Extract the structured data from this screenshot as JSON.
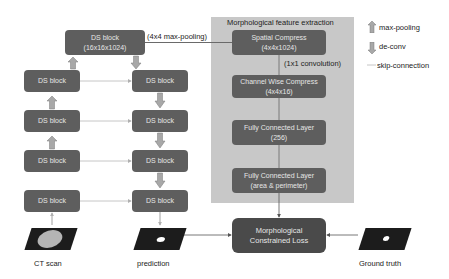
{
  "panel": {
    "title": "Morphological feature extraction"
  },
  "unet": {
    "top_block": {
      "line1": "DS block",
      "line2": "(16x16x1024)"
    },
    "left_blocks": [
      {
        "label": "DS block"
      },
      {
        "label": "DS block"
      },
      {
        "label": "DS block"
      },
      {
        "label": "DS block"
      }
    ],
    "right_blocks": [
      {
        "label": "DS block"
      },
      {
        "label": "DS block"
      },
      {
        "label": "DS block"
      },
      {
        "label": "DS block"
      }
    ]
  },
  "edges": {
    "pooling_label": "(4x4 max-pooling)",
    "conv_label": "(1x1 convolution)"
  },
  "morph": {
    "spatial": {
      "line1": "Spatial Compress",
      "line2": "(4x4x1024)"
    },
    "channel": {
      "line1": "Channel Wise Compress",
      "line2": "(4x4x16)"
    },
    "fc1": {
      "line1": "Fully Connected Layer",
      "line2": "(256)"
    },
    "fc2": {
      "line1": "Fully Connected Layer",
      "line2": "(area & perimeter)"
    },
    "loss": {
      "line1": "Morphological",
      "line2": "Constrained Loss"
    }
  },
  "images": {
    "ct": {
      "label": "CT scan"
    },
    "prediction": {
      "label": "prediction"
    },
    "ground_truth": {
      "label": "Ground truth"
    }
  },
  "legend": {
    "items": [
      {
        "icon": "up-arrow-icon",
        "label": "max-pooling"
      },
      {
        "icon": "down-arrow-icon",
        "label": "de-conv"
      },
      {
        "icon": "skip-arrow-icon",
        "label": "skip-connection"
      }
    ]
  },
  "colors": {
    "block": "#5e5e5e",
    "panel": "#c8c8c8",
    "arrow": "#9a9a9a"
  }
}
